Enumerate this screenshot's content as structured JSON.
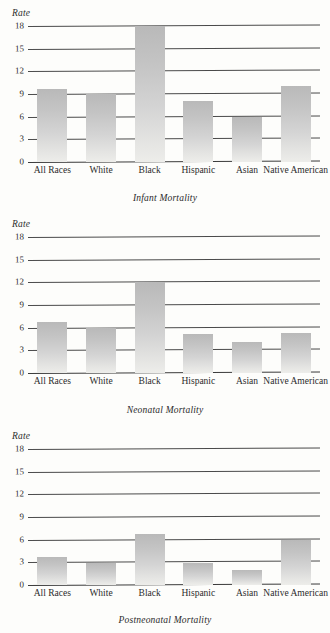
{
  "page": {
    "background_color": "#fdfdfb",
    "bar_color_top": "#b9b9b9",
    "bar_color_bottom": "#ededea",
    "gridline_color": "#4a4a4a"
  },
  "axis": {
    "rate_label": "Rate",
    "ticks": [
      "18",
      "15",
      "12",
      "9",
      "6",
      "3",
      "0"
    ]
  },
  "categories": [
    "All Races",
    "White",
    "Black",
    "Hispanic",
    "Asian",
    "Native American"
  ],
  "charts": [
    {
      "title": "Infant Mortality"
    },
    {
      "title": "Neonatal Mortality"
    },
    {
      "title": "Postneonatal Mortality"
    }
  ],
  "chart_data": [
    {
      "type": "bar",
      "title": "Infant Mortality",
      "xlabel": "",
      "ylabel": "Rate",
      "categories": [
        "All Races",
        "White",
        "Black",
        "Hispanic",
        "Asian",
        "Native American"
      ],
      "values": [
        9.7,
        9.0,
        18.0,
        8.1,
        6.0,
        10.1
      ],
      "ylim": [
        0,
        18
      ],
      "yticks": [
        0,
        3,
        6,
        9,
        12,
        15,
        18
      ],
      "grid": true,
      "legend": "none"
    },
    {
      "type": "bar",
      "title": "Neonatal Mortality",
      "xlabel": "",
      "ylabel": "Rate",
      "categories": [
        "All Races",
        "White",
        "Black",
        "Hispanic",
        "Asian",
        "Native American"
      ],
      "values": [
        6.7,
        6.0,
        12.0,
        5.1,
        4.1,
        5.3
      ],
      "ylim": [
        0,
        18
      ],
      "yticks": [
        0,
        3,
        6,
        9,
        12,
        15,
        18
      ],
      "grid": true,
      "legend": "none"
    },
    {
      "type": "bar",
      "title": "Postneonatal Mortality",
      "xlabel": "",
      "ylabel": "Rate",
      "categories": [
        "All Races",
        "White",
        "Black",
        "Hispanic",
        "Asian",
        "Native American"
      ],
      "values": [
        3.7,
        2.9,
        6.7,
        2.9,
        2.0,
        6.0
      ],
      "ylim": [
        0,
        18
      ],
      "yticks": [
        0,
        3,
        6,
        9,
        12,
        15,
        18
      ],
      "grid": true,
      "legend": "none"
    }
  ]
}
